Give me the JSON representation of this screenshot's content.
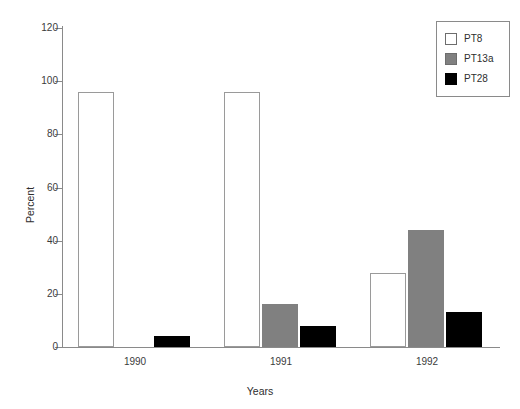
{
  "chart_data": {
    "type": "bar",
    "title": "",
    "subtitle": "",
    "xlabel": "Years",
    "ylabel": "Percent",
    "categories": [
      "1990",
      "1991",
      "1992"
    ],
    "series": [
      {
        "name": "PT8",
        "values": [
          96,
          96,
          28
        ],
        "color": "#ffffff"
      },
      {
        "name": "PT13a",
        "values": [
          0,
          16,
          44
        ],
        "color": "#808080"
      },
      {
        "name": "PT28",
        "values": [
          4,
          8,
          13
        ],
        "color": "#000000"
      }
    ],
    "ylim": [
      0,
      120
    ],
    "yticks": [
      0,
      20,
      40,
      60,
      80,
      100,
      120
    ],
    "ytick_labels": [
      "0",
      "20",
      "40",
      "60",
      "80",
      "100",
      "120"
    ],
    "xtick_labels": [
      "1990",
      "1991",
      "1992"
    ],
    "grid": false,
    "legend_position": "top-right",
    "legend_entries": [
      "PT8",
      "PT13a",
      "PT28"
    ],
    "annotations": []
  },
  "legend": {
    "items": [
      {
        "label": "PT8",
        "swatch": "white-square-swatch"
      },
      {
        "label": "PT13a",
        "swatch": "gray-square-swatch"
      },
      {
        "label": "PT28",
        "swatch": "black-square-swatch"
      }
    ]
  },
  "axes": {
    "y_title": "Percent",
    "x_title": "Years"
  },
  "colors": {
    "series_pt8": "#ffffff",
    "series_pt13a": "#808080",
    "series_pt28": "#000000",
    "axis": "#8a8a8a",
    "text": "#2e2e2e",
    "background": "#ffffff"
  }
}
